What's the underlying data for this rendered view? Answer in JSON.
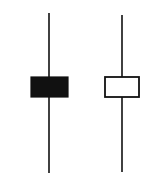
{
  "diagram": {
    "type": "candlestick-comparison",
    "background": "#ffffff",
    "candles": [
      {
        "name": "bearish-candle",
        "kind": "filled",
        "wick_x": 49,
        "wick_top": 13,
        "wick_bottom": 173,
        "body_x": 31,
        "body_y": 77,
        "body_width": 37,
        "body_height": 20,
        "fill": "#111111",
        "stroke": "#111111"
      },
      {
        "name": "bullish-candle",
        "kind": "hollow",
        "wick_x": 122,
        "wick_top": 15,
        "wick_bottom": 172,
        "body_x": 105,
        "body_y": 77,
        "body_width": 34,
        "body_height": 20,
        "fill": "#ffffff",
        "stroke": "#111111"
      }
    ]
  }
}
